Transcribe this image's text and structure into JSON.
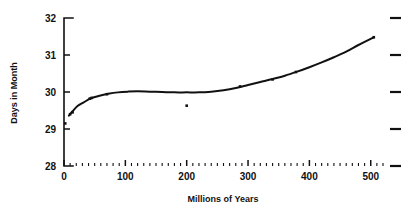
{
  "chart_data": {
    "type": "scatter",
    "title": "",
    "xlabel": "Millions of Years",
    "ylabel": "Days in Month",
    "xlim": [
      0,
      520
    ],
    "ylim": [
      28,
      32
    ],
    "xticks": [
      0,
      100,
      200,
      300,
      400,
      500
    ],
    "xticklabels": [
      "0",
      "100",
      "200",
      "300",
      "400",
      "500"
    ],
    "yticks": [
      28,
      29,
      30,
      31,
      32
    ],
    "yticklabels": [
      "28",
      "29",
      "30",
      "31",
      "32"
    ],
    "x_minor_tick_step": 10,
    "grid": false,
    "legend": null,
    "right_axis_ticks": [
      28,
      29,
      30,
      31,
      32
    ],
    "marker": "square",
    "color": "#111111",
    "x": [
      2,
      10,
      14,
      42,
      45,
      70,
      200,
      287,
      340,
      378,
      505
    ],
    "y": [
      29.15,
      29.4,
      29.45,
      29.82,
      29.84,
      29.94,
      29.63,
      30.15,
      30.34,
      30.54,
      31.48
    ],
    "series": [
      {
        "name": "Days in Month",
        "x": [
          2,
          10,
          14,
          42,
          45,
          70,
          200,
          287,
          340,
          378,
          505
        ],
        "values": [
          29.15,
          29.4,
          29.45,
          29.82,
          29.84,
          29.94,
          29.63,
          30.15,
          30.34,
          30.54,
          31.48
        ]
      }
    ],
    "fit_curve": {
      "name": "smooth fit",
      "x": [
        8,
        14,
        22,
        32,
        44,
        58,
        72,
        88,
        104,
        120,
        140,
        160,
        180,
        200,
        220,
        240,
        260,
        280,
        300,
        320,
        340,
        360,
        380,
        400,
        420,
        440,
        460,
        480,
        505
      ],
      "y": [
        29.36,
        29.48,
        29.62,
        29.72,
        29.83,
        29.9,
        29.95,
        29.99,
        30.01,
        30.02,
        30.01,
        30.0,
        29.99,
        29.99,
        29.99,
        30.01,
        30.05,
        30.11,
        30.19,
        30.27,
        30.35,
        30.44,
        30.55,
        30.67,
        30.8,
        30.94,
        31.09,
        31.27,
        31.48
      ]
    },
    "annotations": []
  }
}
